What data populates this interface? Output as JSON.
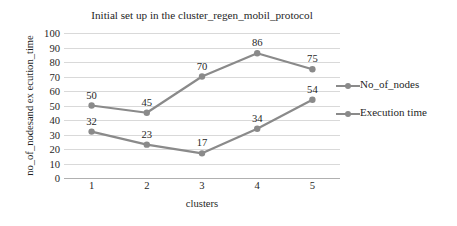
{
  "chart_data": {
    "type": "line",
    "title": "Initial set up in the cluster_regen_mobil_protocol",
    "xlabel": "clusters",
    "ylabel": "no_of_nodesand ex ecution_time",
    "categories": [
      "1",
      "2",
      "3",
      "4",
      "5"
    ],
    "ylim": [
      0,
      100
    ],
    "y_ticks": [
      "100",
      "90",
      "80",
      "70",
      "60",
      "50",
      "40",
      "30",
      "20",
      "10",
      "0"
    ],
    "grid": true,
    "legend_position": "right",
    "series": [
      {
        "name": "No_of_nodes",
        "values": [
          32,
          23,
          17,
          34,
          54
        ],
        "labels": [
          "32",
          "23",
          "17",
          "34",
          "54"
        ],
        "color": "#8a8a8a"
      },
      {
        "name": "Execution time",
        "values": [
          50,
          45,
          70,
          86,
          75
        ],
        "labels": [
          "50",
          "45",
          "70",
          "86",
          "75"
        ],
        "color": "#8a8a8a"
      }
    ]
  },
  "legend": {
    "entries": [
      {
        "label": "No_of_nodes"
      },
      {
        "label": "Execution time"
      }
    ]
  },
  "colors": {
    "series_line": "#8a8a8a",
    "gridline": "#d9d9d9",
    "axis": "#b0b0b0",
    "text": "#1f1f1f",
    "background": "#ffffff"
  }
}
